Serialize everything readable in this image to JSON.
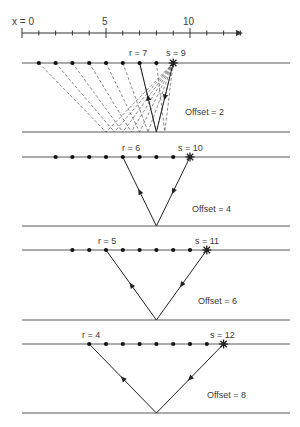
{
  "figure": {
    "type": "diagram",
    "axis": {
      "label_x0": "x = 0",
      "tick_labels": [
        {
          "value": 5,
          "text": "5"
        },
        {
          "value": 10,
          "text": "10"
        }
      ],
      "min": 0,
      "max": 13,
      "minor_tick_step": 1,
      "arrow": true
    },
    "midpoint": 8,
    "panels": [
      {
        "id": "offset-2",
        "receiver_label": "r = 7",
        "source_label": "s = 9",
        "offset_label": "Offset = 2",
        "receiver": 7,
        "source": 9,
        "receivers_dots": [
          1,
          2,
          3,
          4,
          5,
          6,
          7,
          8
        ],
        "dashed_fan": true
      },
      {
        "id": "offset-4",
        "receiver_label": "r = 6",
        "source_label": "s = 10",
        "offset_label": "Offset = 4",
        "receiver": 6,
        "source": 10,
        "receivers_dots": [
          2,
          3,
          4,
          5,
          6,
          7,
          8,
          9
        ],
        "dashed_fan": false
      },
      {
        "id": "offset-6",
        "receiver_label": "r = 5",
        "source_label": "s = 11",
        "offset_label": "Offset = 6",
        "receiver": 5,
        "source": 11,
        "receivers_dots": [
          3,
          4,
          5,
          6,
          7,
          8,
          9,
          10
        ],
        "dashed_fan": false
      },
      {
        "id": "offset-8",
        "receiver_label": "r = 4",
        "source_label": "s = 12",
        "offset_label": "Offset = 8",
        "receiver": 4,
        "source": 12,
        "receivers_dots": [
          4,
          5,
          6,
          7,
          8,
          9,
          10,
          11
        ],
        "dashed_fan": false
      }
    ],
    "colors": {
      "line": "#333333",
      "dash": "#555555",
      "text": "#3a3a3a"
    }
  }
}
